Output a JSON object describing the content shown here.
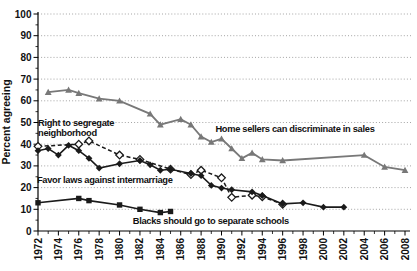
{
  "chart_data": {
    "type": "line",
    "title": "",
    "ylabel": "Percent agreeing",
    "xlabel": "",
    "ylim": [
      0,
      100
    ],
    "xlim": [
      1971,
      2009
    ],
    "y_ticks": [
      0,
      10,
      20,
      30,
      40,
      50,
      60,
      70,
      80,
      90,
      100
    ],
    "x_ticks": [
      1972,
      1974,
      1976,
      1978,
      1980,
      1982,
      1984,
      1986,
      1988,
      1990,
      1992,
      1994,
      1996,
      1998,
      2000,
      2002,
      2004,
      2006,
      2008
    ],
    "grid": "horizontal dotted lines at every 10",
    "legend_position": "inline annotations next to lines",
    "colors": {
      "gray_series": "#787878",
      "black_series": "#1a1a1a",
      "gridline": "#9b9b9b",
      "axis": "#000000"
    },
    "series": [
      {
        "id": "home-sellers",
        "name": "Home sellers can discriminate in sales",
        "color": "#787878",
        "line_style": "solid",
        "marker": "triangle",
        "width": 1.8,
        "points": [
          [
            1973,
            64
          ],
          [
            1975,
            65
          ],
          [
            1976,
            63.5
          ],
          [
            1978,
            61
          ],
          [
            1980,
            60
          ],
          [
            1983,
            54
          ],
          [
            1984,
            49
          ],
          [
            1986,
            51.5
          ],
          [
            1987,
            49
          ],
          [
            1988,
            43.5
          ],
          [
            1989,
            41
          ],
          [
            1990,
            42.5
          ],
          [
            1991,
            38
          ],
          [
            1992,
            33.5
          ],
          [
            1993,
            36
          ],
          [
            1994,
            33
          ],
          [
            1996,
            32.5
          ],
          [
            2004,
            35
          ],
          [
            2006,
            29.5
          ],
          [
            2008,
            28
          ]
        ]
      },
      {
        "id": "segregate-neighborhood",
        "name": "Right to segregate neighborhood",
        "color": "#1a1a1a",
        "line_style": "dashed",
        "marker": "open-diamond",
        "width": 1.5,
        "points": [
          [
            1972,
            39
          ],
          [
            1976,
            40
          ],
          [
            1977,
            41.5
          ],
          [
            1980,
            35
          ],
          [
            1982,
            33
          ],
          [
            1985,
            28.5
          ],
          [
            1987,
            26
          ],
          [
            1988,
            28
          ],
          [
            1990,
            24.5
          ],
          [
            1991,
            15.5
          ],
          [
            1993,
            16.5
          ],
          [
            1994,
            15.8
          ],
          [
            1996,
            12.3
          ]
        ]
      },
      {
        "id": "intermarriage",
        "name": "Favor laws against intermarriage",
        "color": "#1a1a1a",
        "line_style": "solid",
        "marker": "diamond",
        "width": 1.6,
        "points": [
          [
            1972,
            37
          ],
          [
            1973,
            38
          ],
          [
            1974,
            35
          ],
          [
            1975,
            39.5
          ],
          [
            1976,
            37
          ],
          [
            1977,
            33.5
          ],
          [
            1978,
            29
          ],
          [
            1980,
            31
          ],
          [
            1982,
            32.5
          ],
          [
            1983,
            30.5
          ],
          [
            1984,
            28
          ],
          [
            1985,
            28.5
          ],
          [
            1987,
            26.5
          ],
          [
            1988,
            25.5
          ],
          [
            1989,
            21
          ],
          [
            1990,
            19.8
          ],
          [
            1991,
            19
          ],
          [
            1993,
            18
          ],
          [
            1994,
            16.3
          ],
          [
            1996,
            12.5
          ],
          [
            1998,
            13
          ],
          [
            2000,
            11
          ],
          [
            2002,
            11
          ]
        ]
      },
      {
        "id": "separate-schools",
        "name": "Blacks should go to separate schools",
        "color": "#1a1a1a",
        "line_style": "solid",
        "marker": "square",
        "width": 1.6,
        "points": [
          [
            1972,
            13
          ],
          [
            1976,
            15
          ],
          [
            1977,
            14
          ],
          [
            1980,
            12
          ],
          [
            1982,
            10
          ],
          [
            1984,
            8.5
          ],
          [
            1985,
            9
          ]
        ]
      }
    ],
    "annotations": [
      {
        "id": "label-segregate-neighborhood",
        "text": "Right to segregate\nneighborhood",
        "year": 1972.0,
        "pct": 48.5
      },
      {
        "id": "label-home-sellers",
        "text": "Home sellers can discriminate in sales",
        "year": 1989.4,
        "pct": 45.8
      },
      {
        "id": "label-intermarriage",
        "text": "Favor laws against intermarriage",
        "year": 1971.9,
        "pct": 22.0
      },
      {
        "id": "label-separate-schools",
        "text": "Blacks should go to separate schools",
        "year": 1981.3,
        "pct": 3.0
      }
    ]
  }
}
